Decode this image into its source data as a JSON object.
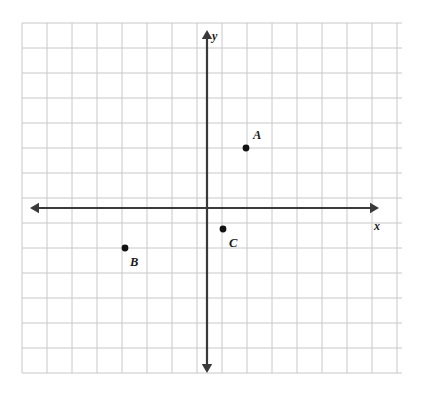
{
  "figure": {
    "background_color": "#ffffff",
    "grid": {
      "line_color": "#c8c8cc",
      "line_width": 1,
      "spacing_px": 25,
      "left_px": 22,
      "top_px": 23,
      "right_px": 402,
      "bottom_px": 373,
      "columns": 16,
      "rows": 15,
      "visible": true
    },
    "axes": {
      "color": "#3a3a3a",
      "line_width": 2.2,
      "origin_px": {
        "x": 207,
        "y": 208
      },
      "x_axis": {
        "name": "x-axis",
        "label": "x",
        "label_px": {
          "x": 374,
          "y": 230
        },
        "start_px": {
          "x": 30,
          "y": 208
        },
        "end_px": {
          "x": 379,
          "y": 208
        },
        "arrow_start": true,
        "arrow_end": true
      },
      "y_axis": {
        "name": "y-axis",
        "label": "y",
        "label_px": {
          "x": 212,
          "y": 40
        },
        "start_px": {
          "x": 207,
          "y": 30
        },
        "end_px": {
          "x": 207,
          "y": 373
        },
        "arrow_start": true,
        "arrow_end": true
      }
    },
    "points": [
      {
        "id": "A",
        "label": "A",
        "dot_px": {
          "x": 246,
          "y": 148
        },
        "label_px": {
          "x": 253,
          "y": 139
        },
        "dot_radius": 3.4,
        "color": "#111111",
        "quadrant": "I"
      },
      {
        "id": "B",
        "label": "B",
        "dot_px": {
          "x": 125,
          "y": 248
        },
        "label_px": {
          "x": 130,
          "y": 266
        },
        "dot_radius": 3.4,
        "color": "#111111",
        "quadrant": "III"
      },
      {
        "id": "C",
        "label": "C",
        "dot_px": {
          "x": 223,
          "y": 229
        },
        "label_px": {
          "x": 229,
          "y": 247
        },
        "dot_radius": 3.4,
        "color": "#111111",
        "quadrant": "IV"
      }
    ]
  }
}
